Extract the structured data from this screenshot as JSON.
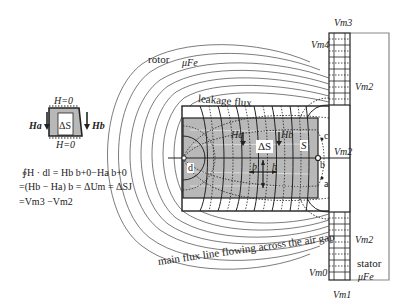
{
  "diagram": {
    "labels": {
      "rotor": "rotor",
      "mu_fe_rotor": "μFe",
      "leakage_flux": "leakage flux",
      "main_flux": "main flux line flowing across the air gap",
      "stator": "stator",
      "mu_fe_stator": "μFe",
      "vm3": "Vm3",
      "vm4": "Vm4",
      "vm2_top": "Vm2",
      "vm2_mid": "Vm2",
      "vm2_bottom": "Vm2",
      "vm0": "Vm0",
      "vm1": "Vm1",
      "h_a_field": "Ha",
      "h_b_field": "Hb",
      "delta_s": "ΔS",
      "s": "S",
      "b": "b",
      "h": "h",
      "point_a": "a",
      "point_b": "b",
      "point_c": "c",
      "point_d": "d"
    },
    "inset": {
      "h_top": "H=0",
      "h_bottom": "H=0",
      "h_a": "Ha",
      "h_b": "Hb",
      "delta_s": "ΔS"
    },
    "equation": {
      "line1": "∮H · dl = Hb b+0−Ha b+0",
      "line2": "=(Hb − Ha) b = ΔUm = ΔSJ",
      "line3": "=Vm3 −Vm2"
    },
    "colors": {
      "conductor_fill": "#b8b8b8",
      "line": "#222222",
      "stator_border": "#888888"
    }
  }
}
